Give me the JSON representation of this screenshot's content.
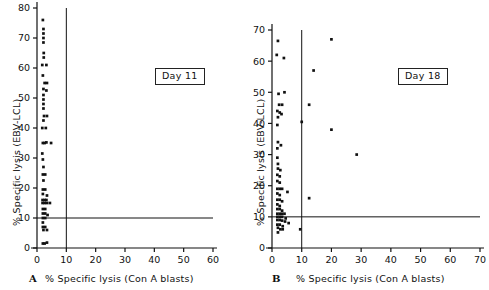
{
  "figure": {
    "background": "#ffffff",
    "ink_color": "#111111",
    "point_color": "#111111"
  },
  "chart_data": [
    {
      "type": "scatter",
      "panel": "A",
      "panel_letter": "A",
      "title": "Day 11",
      "xlabel": "% Specific lysis (Con A blasts)",
      "ylabel": "% Specific lysis (EBV-LCL)",
      "xlim": [
        0,
        60
      ],
      "ylim": [
        0,
        80
      ],
      "xticks": [
        0,
        10,
        20,
        30,
        40,
        50,
        60
      ],
      "yticks": [
        0,
        10,
        20,
        30,
        40,
        50,
        60,
        70,
        80
      ],
      "grid": false,
      "legend": "none",
      "annotations": [
        {
          "name": "threshold-line-horizontal",
          "type": "hline",
          "y": 10,
          "x_from": 0,
          "x_to": 60
        },
        {
          "name": "threshold-line-vertical",
          "type": "vline",
          "x": 10,
          "y_from": 0,
          "y_to": 80
        }
      ],
      "points": [
        {
          "x": 2.0,
          "y": 76.0
        },
        {
          "x": 2.2,
          "y": 73.0
        },
        {
          "x": 2.2,
          "y": 71.5
        },
        {
          "x": 2.2,
          "y": 70.0
        },
        {
          "x": 2.2,
          "y": 68.5
        },
        {
          "x": 2.3,
          "y": 65.0
        },
        {
          "x": 2.3,
          "y": 63.5
        },
        {
          "x": 1.8,
          "y": 61.0
        },
        {
          "x": 3.2,
          "y": 61.0
        },
        {
          "x": 2.0,
          "y": 57.5
        },
        {
          "x": 2.6,
          "y": 55.0
        },
        {
          "x": 3.4,
          "y": 55.0
        },
        {
          "x": 2.2,
          "y": 53.0
        },
        {
          "x": 3.2,
          "y": 52.5
        },
        {
          "x": 2.2,
          "y": 51.0
        },
        {
          "x": 2.2,
          "y": 49.5
        },
        {
          "x": 2.2,
          "y": 48.0
        },
        {
          "x": 2.2,
          "y": 46.5
        },
        {
          "x": 2.4,
          "y": 44.0
        },
        {
          "x": 3.4,
          "y": 44.0
        },
        {
          "x": 2.2,
          "y": 42.5
        },
        {
          "x": 1.8,
          "y": 40.0
        },
        {
          "x": 3.0,
          "y": 40.0
        },
        {
          "x": 2.0,
          "y": 35.0
        },
        {
          "x": 2.6,
          "y": 35.0
        },
        {
          "x": 3.2,
          "y": 35.2
        },
        {
          "x": 4.8,
          "y": 35.0
        },
        {
          "x": 1.8,
          "y": 31.5
        },
        {
          "x": 2.0,
          "y": 29.5
        },
        {
          "x": 2.2,
          "y": 27.0
        },
        {
          "x": 2.0,
          "y": 24.5
        },
        {
          "x": 2.8,
          "y": 24.5
        },
        {
          "x": 2.2,
          "y": 22.5
        },
        {
          "x": 2.0,
          "y": 19.5
        },
        {
          "x": 2.8,
          "y": 19.5
        },
        {
          "x": 2.0,
          "y": 18.0
        },
        {
          "x": 3.4,
          "y": 17.5
        },
        {
          "x": 1.9,
          "y": 16.0
        },
        {
          "x": 2.6,
          "y": 16.0
        },
        {
          "x": 3.2,
          "y": 16.0
        },
        {
          "x": 1.9,
          "y": 15.0
        },
        {
          "x": 2.6,
          "y": 15.0
        },
        {
          "x": 3.4,
          "y": 15.0
        },
        {
          "x": 4.4,
          "y": 15.0
        },
        {
          "x": 2.0,
          "y": 13.0
        },
        {
          "x": 2.8,
          "y": 13.0
        },
        {
          "x": 2.0,
          "y": 11.5
        },
        {
          "x": 2.8,
          "y": 11.5
        },
        {
          "x": 3.6,
          "y": 11.0
        },
        {
          "x": 2.0,
          "y": 10.0
        },
        {
          "x": 2.8,
          "y": 10.0
        },
        {
          "x": 2.0,
          "y": 8.5
        },
        {
          "x": 2.0,
          "y": 7.0
        },
        {
          "x": 2.8,
          "y": 7.0
        },
        {
          "x": 2.2,
          "y": 6.0
        },
        {
          "x": 3.4,
          "y": 6.0
        },
        {
          "x": 2.0,
          "y": 1.5
        },
        {
          "x": 2.6,
          "y": 1.5
        },
        {
          "x": 3.4,
          "y": 1.8
        }
      ]
    },
    {
      "type": "scatter",
      "panel": "B",
      "panel_letter": "B",
      "title": "Day 18",
      "xlabel": "% Specific lysis (Con A blasts)",
      "ylabel": "% Specific lysis (EBV-LCL)",
      "xlim": [
        0,
        70
      ],
      "ylim": [
        0,
        70
      ],
      "xticks": [
        0,
        10,
        20,
        30,
        40,
        50,
        60,
        70
      ],
      "yticks": [
        0,
        10,
        20,
        30,
        40,
        50,
        60,
        70
      ],
      "grid": false,
      "legend": "none",
      "annotations": [
        {
          "name": "threshold-line-horizontal",
          "type": "hline",
          "y": 10,
          "x_from": 0,
          "x_to": 70
        },
        {
          "name": "threshold-line-vertical",
          "type": "vline",
          "x": 10,
          "y_from": 0,
          "y_to": 70
        }
      ],
      "points": [
        {
          "x": 2.0,
          "y": 66.5
        },
        {
          "x": 1.6,
          "y": 62.0
        },
        {
          "x": 4.0,
          "y": 61.0
        },
        {
          "x": 20.0,
          "y": 67.0
        },
        {
          "x": 14.0,
          "y": 57.0
        },
        {
          "x": 2.2,
          "y": 49.5
        },
        {
          "x": 4.2,
          "y": 50.0
        },
        {
          "x": 2.4,
          "y": 46.0
        },
        {
          "x": 3.4,
          "y": 46.0
        },
        {
          "x": 1.8,
          "y": 44.0
        },
        {
          "x": 2.6,
          "y": 43.5
        },
        {
          "x": 3.2,
          "y": 43.0
        },
        {
          "x": 2.0,
          "y": 42.0
        },
        {
          "x": 12.5,
          "y": 46.0
        },
        {
          "x": 10.0,
          "y": 40.5
        },
        {
          "x": 1.8,
          "y": 39.5
        },
        {
          "x": 20.0,
          "y": 38.0
        },
        {
          "x": 2.0,
          "y": 34.0
        },
        {
          "x": 3.0,
          "y": 33.0
        },
        {
          "x": 1.8,
          "y": 32.0
        },
        {
          "x": 28.5,
          "y": 30.0
        },
        {
          "x": 1.8,
          "y": 29.0
        },
        {
          "x": 2.0,
          "y": 27.0
        },
        {
          "x": 2.0,
          "y": 25.5
        },
        {
          "x": 2.8,
          "y": 25.0
        },
        {
          "x": 1.8,
          "y": 23.5
        },
        {
          "x": 2.6,
          "y": 23.0
        },
        {
          "x": 1.8,
          "y": 21.5
        },
        {
          "x": 2.6,
          "y": 21.0
        },
        {
          "x": 1.8,
          "y": 19.0
        },
        {
          "x": 2.6,
          "y": 19.0
        },
        {
          "x": 3.4,
          "y": 19.0
        },
        {
          "x": 5.2,
          "y": 18.0
        },
        {
          "x": 1.8,
          "y": 17.5
        },
        {
          "x": 2.6,
          "y": 17.0
        },
        {
          "x": 12.5,
          "y": 16.0
        },
        {
          "x": 1.8,
          "y": 15.5
        },
        {
          "x": 2.6,
          "y": 15.5
        },
        {
          "x": 3.4,
          "y": 15.0
        },
        {
          "x": 1.8,
          "y": 14.0
        },
        {
          "x": 2.6,
          "y": 13.5
        },
        {
          "x": 1.8,
          "y": 12.5
        },
        {
          "x": 2.6,
          "y": 12.5
        },
        {
          "x": 3.4,
          "y": 12.0
        },
        {
          "x": 1.8,
          "y": 11.0
        },
        {
          "x": 2.6,
          "y": 11.0
        },
        {
          "x": 3.4,
          "y": 11.0
        },
        {
          "x": 4.2,
          "y": 11.0
        },
        {
          "x": 1.8,
          "y": 10.0
        },
        {
          "x": 2.6,
          "y": 10.0
        },
        {
          "x": 3.4,
          "y": 10.0
        },
        {
          "x": 4.6,
          "y": 9.5
        },
        {
          "x": 1.8,
          "y": 9.0
        },
        {
          "x": 2.6,
          "y": 9.0
        },
        {
          "x": 3.4,
          "y": 8.8
        },
        {
          "x": 4.4,
          "y": 8.5
        },
        {
          "x": 5.6,
          "y": 8.0
        },
        {
          "x": 1.8,
          "y": 7.5
        },
        {
          "x": 2.6,
          "y": 7.5
        },
        {
          "x": 3.6,
          "y": 7.0
        },
        {
          "x": 2.0,
          "y": 6.5
        },
        {
          "x": 2.8,
          "y": 6.0
        },
        {
          "x": 3.6,
          "y": 6.0
        },
        {
          "x": 9.5,
          "y": 6.0
        },
        {
          "x": 2.0,
          "y": 5.0
        }
      ]
    }
  ]
}
